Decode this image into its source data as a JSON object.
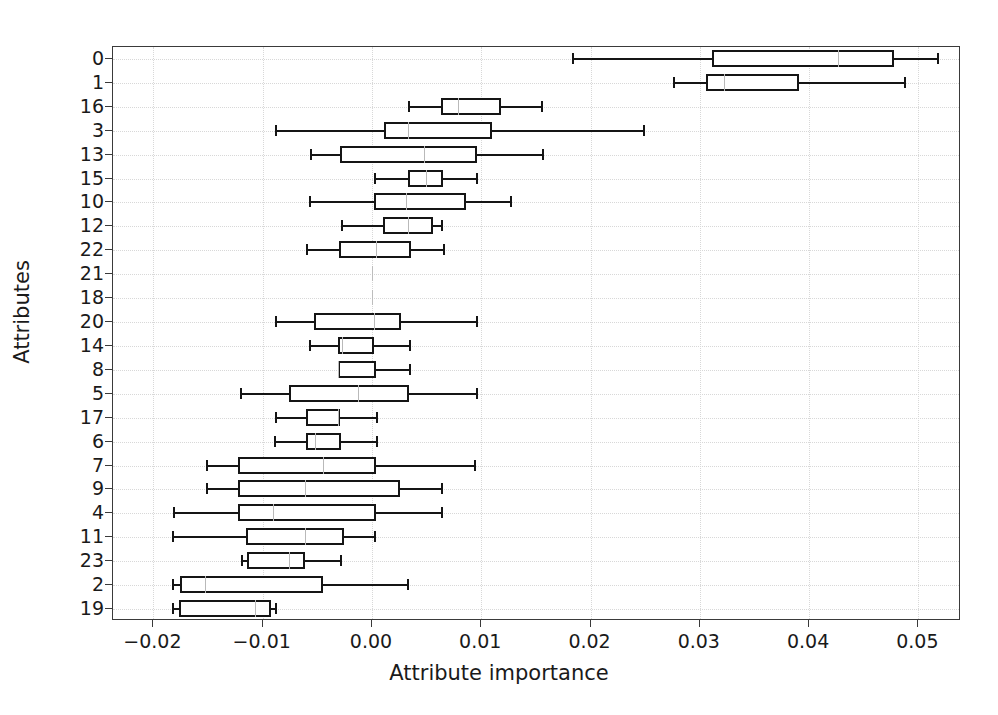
{
  "chart_data": {
    "type": "box",
    "title": "",
    "xlabel": "Attribute importance",
    "ylabel": "Attributes",
    "xlim": [
      -0.0237,
      0.0539
    ],
    "xticks": [
      -0.02,
      -0.01,
      0.0,
      0.01,
      0.02,
      0.03,
      0.04,
      0.05
    ],
    "xticklabels": [
      "−0.02",
      "−0.01",
      "0.00",
      "0.01",
      "0.02",
      "0.03",
      "0.04",
      "0.05"
    ],
    "grid": true,
    "orientation": "horizontal",
    "legend": null,
    "categories": [
      "0",
      "1",
      "16",
      "3",
      "13",
      "15",
      "10",
      "12",
      "22",
      "21",
      "18",
      "20",
      "14",
      "8",
      "5",
      "17",
      "6",
      "7",
      "9",
      "4",
      "11",
      "23",
      "2",
      "19"
    ],
    "boxes": [
      {
        "label": "0",
        "whisker_low": 0.0183,
        "q1": 0.0311,
        "median": 0.0426,
        "q3": 0.0478,
        "whisker_high": 0.0517
      },
      {
        "label": "1",
        "whisker_low": 0.0275,
        "q1": 0.0306,
        "median": 0.0322,
        "q3": 0.0391,
        "whisker_high": 0.0487
      },
      {
        "label": "16",
        "whisker_low": 0.0033,
        "q1": 0.0063,
        "median": 0.0079,
        "q3": 0.0118,
        "whisker_high": 0.0155
      },
      {
        "label": "3",
        "whisker_low": -0.0089,
        "q1": 0.0011,
        "median": 0.0033,
        "q3": 0.011,
        "whisker_high": 0.0248
      },
      {
        "label": "13",
        "whisker_low": -0.0057,
        "q1": -0.0029,
        "median": 0.0048,
        "q3": 0.0096,
        "whisker_high": 0.0156
      },
      {
        "label": "15",
        "whisker_low": 0.0002,
        "q1": 0.0033,
        "median": 0.0049,
        "q3": 0.0065,
        "whisker_high": 0.0095
      },
      {
        "label": "10",
        "whisker_low": -0.0058,
        "q1": 0.0002,
        "median": 0.0031,
        "q3": 0.0086,
        "whisker_high": 0.0126
      },
      {
        "label": "12",
        "whisker_low": -0.0028,
        "q1": 0.001,
        "median": 0.0033,
        "q3": 0.0056,
        "whisker_high": 0.0063
      },
      {
        "label": "22",
        "whisker_low": -0.006,
        "q1": -0.003,
        "median": 0.0004,
        "q3": 0.0036,
        "whisker_high": 0.0065
      },
      {
        "label": "21",
        "whisker_low": 0.0,
        "q1": 0.0,
        "median": 0.0,
        "q3": 0.0,
        "whisker_high": 0.0
      },
      {
        "label": "18",
        "whisker_low": 0.0,
        "q1": 0.0,
        "median": 0.0,
        "q3": 0.0,
        "whisker_high": 0.0
      },
      {
        "label": "20",
        "whisker_low": -0.0089,
        "q1": -0.0053,
        "median": 0.0002,
        "q3": 0.0027,
        "whisker_high": 0.0095
      },
      {
        "label": "14",
        "whisker_low": -0.0058,
        "q1": -0.0031,
        "median": -0.0027,
        "q3": 0.0002,
        "whisker_high": 0.0034
      },
      {
        "label": "8",
        "whisker_low": -0.0031,
        "q1": -0.0031,
        "median": -0.0031,
        "q3": 0.0004,
        "whisker_high": 0.0034
      },
      {
        "label": "5",
        "whisker_low": -0.0121,
        "q1": -0.0076,
        "median": -0.0013,
        "q3": 0.0034,
        "whisker_high": 0.0095
      },
      {
        "label": "17",
        "whisker_low": -0.0089,
        "q1": -0.006,
        "median": -0.0031,
        "q3": -0.0029,
        "whisker_high": 0.0004
      },
      {
        "label": "6",
        "whisker_low": -0.009,
        "q1": -0.006,
        "median": -0.0052,
        "q3": -0.0028,
        "whisker_high": 0.0004
      },
      {
        "label": "7",
        "whisker_low": -0.0152,
        "q1": -0.0123,
        "median": -0.0045,
        "q3": 0.0004,
        "whisker_high": 0.0093
      },
      {
        "label": "9",
        "whisker_low": -0.0152,
        "q1": -0.0123,
        "median": -0.0061,
        "q3": 0.0026,
        "whisker_high": 0.0063
      },
      {
        "label": "4",
        "whisker_low": -0.0182,
        "q1": -0.0123,
        "median": -0.0091,
        "q3": 0.0004,
        "whisker_high": 0.0063
      },
      {
        "label": "11",
        "whisker_low": -0.0183,
        "q1": -0.0115,
        "median": -0.0061,
        "q3": -0.0026,
        "whisker_high": 0.0002
      },
      {
        "label": "23",
        "whisker_low": -0.012,
        "q1": -0.0114,
        "median": -0.0076,
        "q3": -0.0061,
        "whisker_high": -0.0029
      },
      {
        "label": "2",
        "whisker_low": -0.0183,
        "q1": -0.0176,
        "median": -0.0153,
        "q3": -0.0045,
        "whisker_high": 0.0032
      },
      {
        "label": "19",
        "whisker_low": -0.0183,
        "q1": -0.0177,
        "median": -0.0107,
        "q3": -0.0092,
        "whisker_high": -0.0089
      }
    ]
  },
  "style": {
    "line_color": "#151515",
    "median_color": "#b9b9b9",
    "frame_color": "#3a3a3a",
    "grid_color": "#d8d8d8",
    "background": "#ffffff"
  }
}
